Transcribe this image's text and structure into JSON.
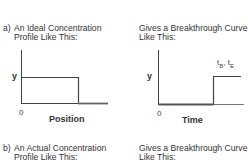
{
  "panel_a": {
    "letter": "a)",
    "caption_line1": "An Ideal Concentration",
    "caption_line2": "Profile Like This:",
    "plot": {
      "ylabel": "y",
      "xlabel": "Position",
      "origin": "0"
    }
  },
  "panel_a_right": {
    "caption_line1": "Gives a Breakthrough Curve",
    "caption_line2": "Like This:",
    "plot": {
      "ylabel": "y",
      "xlabel": "Time",
      "origin": "0",
      "annotation_main1": "t",
      "annotation_sub1": "B",
      "annotation_sep": ", ",
      "annotation_main2": "t",
      "annotation_sub2": "E"
    }
  },
  "panel_b": {
    "letter": "b)",
    "caption_line1": "An Actual Concentration",
    "caption_line2": "Profile Like This:"
  },
  "panel_b_right": {
    "caption_line1": "Gives a Breakthrough Curve",
    "caption_line2": "Like This:"
  },
  "colors": {
    "line": "#333333",
    "text": "#333333"
  }
}
